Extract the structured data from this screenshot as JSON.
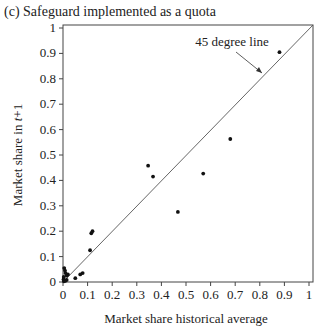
{
  "chart_data": {
    "type": "scatter",
    "title": "(c) Safeguard implemented as a quota",
    "xlabel": "Market share historical average",
    "ylabel": "Market share in t+1",
    "xlim": [
      0,
      1
    ],
    "ylim": [
      0,
      1
    ],
    "xticks": [
      "0",
      "0.1",
      "0.2",
      "0.3",
      "0.4",
      "0.5",
      "0.6",
      "0.7",
      "0.8",
      "0.9",
      "1"
    ],
    "yticks": [
      "0",
      "0.1",
      "0.2",
      "0.3",
      "0.4",
      "0.5",
      "0.6",
      "0.7",
      "0.8",
      "0.9",
      "1"
    ],
    "grid": false,
    "annotation": "45 degree line",
    "reference_line": {
      "x": [
        0,
        1
      ],
      "y": [
        0,
        1
      ]
    },
    "points": [
      {
        "x": 0.88,
        "y": 0.905
      },
      {
        "x": 0.68,
        "y": 0.563
      },
      {
        "x": 0.57,
        "y": 0.427
      },
      {
        "x": 0.467,
        "y": 0.276
      },
      {
        "x": 0.346,
        "y": 0.458
      },
      {
        "x": 0.366,
        "y": 0.415
      },
      {
        "x": 0.12,
        "y": 0.2
      },
      {
        "x": 0.115,
        "y": 0.192
      },
      {
        "x": 0.11,
        "y": 0.125
      },
      {
        "x": 0.08,
        "y": 0.035
      },
      {
        "x": 0.07,
        "y": 0.03
      },
      {
        "x": 0.05,
        "y": 0.015
      },
      {
        "x": 0.02,
        "y": 0.03
      },
      {
        "x": 0.015,
        "y": 0.025
      },
      {
        "x": 0.01,
        "y": 0.035
      },
      {
        "x": 0.008,
        "y": 0.045
      },
      {
        "x": 0.005,
        "y": 0.055
      },
      {
        "x": 0.003,
        "y": 0.02
      },
      {
        "x": 0.002,
        "y": 0.01
      },
      {
        "x": 0.004,
        "y": 0.003
      },
      {
        "x": 0.01,
        "y": 0.005
      },
      {
        "x": 0.015,
        "y": 0.008
      }
    ]
  }
}
